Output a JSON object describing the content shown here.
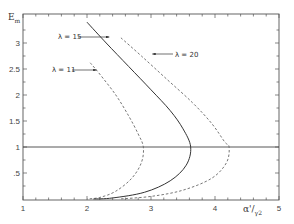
{
  "chart_data": {
    "type": "line",
    "title": "",
    "xlabel": "α'/γ2",
    "ylabel": "Em",
    "xlim": [
      1,
      5
    ],
    "ylim": [
      0,
      3.45
    ],
    "grid": false,
    "legend_position": "inline labels with arrows",
    "x_ticks": [
      "1",
      "2",
      "3",
      "4",
      "5"
    ],
    "y_ticks": [
      ".5",
      "1",
      "1.5",
      "2",
      "2.5",
      "3"
    ],
    "reference_line": {
      "y": 1,
      "x_from": 1,
      "x_to": 5,
      "style": "solid"
    },
    "series": [
      {
        "name": "λ=11",
        "label": "λ = 11",
        "style": "dashed",
        "points": [
          [
            2.05,
            2.62
          ],
          [
            2.2,
            2.4
          ],
          [
            2.45,
            2.0
          ],
          [
            2.65,
            1.6
          ],
          [
            2.8,
            1.25
          ],
          [
            2.88,
            1.0
          ],
          [
            2.85,
            0.7
          ],
          [
            2.7,
            0.4
          ],
          [
            2.45,
            0.15
          ],
          [
            2.2,
            0.03
          ],
          [
            2.0,
            0.0
          ]
        ]
      },
      {
        "name": "λ=15",
        "label": "λ = 15",
        "style": "solid",
        "points": [
          [
            2.0,
            3.4
          ],
          [
            2.3,
            3.0
          ],
          [
            2.65,
            2.55
          ],
          [
            3.0,
            2.1
          ],
          [
            3.3,
            1.7
          ],
          [
            3.5,
            1.35
          ],
          [
            3.62,
            1.0
          ],
          [
            3.55,
            0.65
          ],
          [
            3.3,
            0.35
          ],
          [
            2.9,
            0.13
          ],
          [
            2.4,
            0.02
          ],
          [
            2.1,
            0.0
          ]
        ]
      },
      {
        "name": "λ=20",
        "label": "λ = 20",
        "style": "dashed",
        "points": [
          [
            2.53,
            3.1
          ],
          [
            2.85,
            2.75
          ],
          [
            3.25,
            2.3
          ],
          [
            3.65,
            1.85
          ],
          [
            3.95,
            1.45
          ],
          [
            4.15,
            1.1
          ],
          [
            4.22,
            1.0
          ],
          [
            4.18,
            0.7
          ],
          [
            3.95,
            0.4
          ],
          [
            3.5,
            0.17
          ],
          [
            3.0,
            0.05
          ],
          [
            2.5,
            0.0
          ]
        ]
      }
    ],
    "annotations": [
      {
        "text": "λ = 15",
        "arrow_to": [
          2.35,
          3.05
        ]
      },
      {
        "text": "λ = 11",
        "arrow_to": [
          2.2,
          2.4
        ]
      },
      {
        "text": "λ = 20",
        "arrow_to": [
          3.05,
          2.5
        ]
      }
    ]
  },
  "labels": {
    "ylabel_main": "E",
    "ylabel_sub": "m",
    "xlabel_main": "α'/",
    "xlabel_sub": "γ2",
    "lambda11": "λ = 11",
    "lambda15": "λ = 15",
    "lambda20": "λ = 20"
  }
}
